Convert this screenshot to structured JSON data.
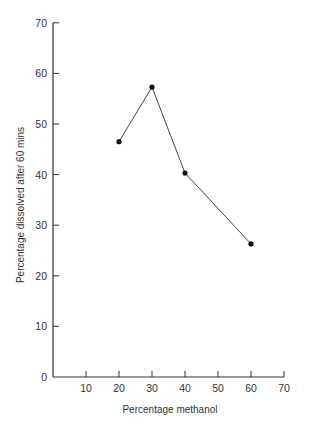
{
  "chart_data": {
    "type": "line",
    "title": "",
    "xlabel": "Percentage methanol",
    "ylabel": "Percentage dissolved after 60 mins",
    "x": [
      20,
      30,
      40,
      60
    ],
    "series": [
      {
        "name": "dissolved",
        "values": [
          46.5,
          57.3,
          40.3,
          26.3
        ],
        "markers": true
      }
    ],
    "xlim": [
      0,
      70
    ],
    "ylim": [
      0,
      70
    ],
    "xticks": [
      10,
      20,
      30,
      40,
      50,
      60,
      70
    ],
    "yticks": [
      0,
      10,
      20,
      30,
      40,
      50,
      60,
      70
    ],
    "grid": false,
    "legend": null
  },
  "colors": {
    "line": "#444444",
    "marker": "#111111",
    "axis": "#333333"
  }
}
